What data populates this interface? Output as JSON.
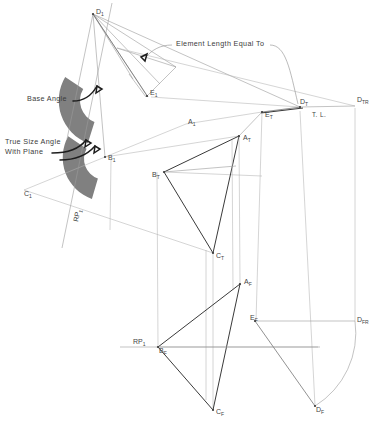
{
  "drawing": {
    "title": "Descriptive Geometry Multiview Construction",
    "width": 390,
    "height": 432,
    "background": "#ffffff",
    "colors": {
      "paper": "#ffffff",
      "thin_line": "#9a9a9a",
      "light_line": "#b2b2b2",
      "heavy_line": "#3a3a3a",
      "medium_line": "#6d6d6d",
      "leader": "#8d8d8d",
      "arrow": "#1d1d1d",
      "wedge_fill": "#808080",
      "text": "#444444"
    }
  },
  "annotations": [
    {
      "name": "element-length-note",
      "text": "Element Length Equal To",
      "x": 176,
      "y": 46,
      "anchor": "start"
    },
    {
      "name": "base-angle-note",
      "text": "Base Angle",
      "x": 27,
      "y": 101,
      "anchor": "start"
    },
    {
      "name": "true-size-angle-note-line1",
      "text": "True Size Angle",
      "x": 5,
      "y": 144,
      "anchor": "start"
    },
    {
      "name": "true-size-angle-note-line2",
      "text": "With Plane",
      "x": 5,
      "y": 154,
      "anchor": "start"
    },
    {
      "name": "true-length-note",
      "text": "T. L.",
      "x": 312,
      "y": 117,
      "anchor": "start"
    }
  ],
  "points": [
    {
      "name": "point-D1",
      "base": "D",
      "sub": "1",
      "x": 93,
      "y": 14,
      "lx": 96,
      "ly": 14,
      "marker": true
    },
    {
      "name": "point-E1",
      "base": "E",
      "sub": "1",
      "x": 147,
      "y": 96,
      "lx": 150,
      "ly": 95,
      "marker": true
    },
    {
      "name": "point-A1",
      "base": "A",
      "sub": "1",
      "x": 186,
      "y": 124,
      "lx": 188,
      "ly": 124,
      "marker": false
    },
    {
      "name": "point-B1",
      "base": "B",
      "sub": "1",
      "x": 105,
      "y": 157,
      "lx": 108,
      "ly": 160,
      "marker": true
    },
    {
      "name": "point-C1",
      "base": "C",
      "sub": "1",
      "x": 24,
      "y": 190,
      "lx": 24,
      "ly": 196,
      "marker": false
    },
    {
      "name": "point-AT",
      "base": "A",
      "sub": "T",
      "x": 239,
      "y": 136,
      "lx": 243,
      "ly": 140,
      "marker": true
    },
    {
      "name": "point-BT",
      "base": "B",
      "sub": "T",
      "x": 164,
      "y": 172,
      "lx": 152,
      "ly": 177,
      "marker": true
    },
    {
      "name": "point-CT",
      "base": "C",
      "sub": "T",
      "x": 213,
      "y": 253,
      "lx": 216,
      "ly": 258,
      "marker": true
    },
    {
      "name": "point-ET",
      "base": "E",
      "sub": "T",
      "x": 262,
      "y": 112,
      "lx": 265,
      "ly": 117,
      "marker": true
    },
    {
      "name": "point-DT",
      "base": "D",
      "sub": "T",
      "x": 300,
      "y": 107,
      "lx": 300,
      "ly": 104,
      "marker": true
    },
    {
      "name": "point-DTR",
      "base": "D",
      "sub": "TR",
      "x": 355,
      "y": 106,
      "lx": 357,
      "ly": 102,
      "marker": false
    },
    {
      "name": "point-AF",
      "base": "A",
      "sub": "F",
      "x": 240,
      "y": 284,
      "lx": 244,
      "ly": 284,
      "marker": true
    },
    {
      "name": "point-BF",
      "base": "B",
      "sub": "F",
      "x": 158,
      "y": 347,
      "lx": 159,
      "ly": 353,
      "marker": true
    },
    {
      "name": "point-CF",
      "base": "C",
      "sub": "F",
      "x": 213,
      "y": 410,
      "lx": 216,
      "ly": 414,
      "marker": true
    },
    {
      "name": "point-EF",
      "base": "E",
      "sub": "F",
      "x": 255,
      "y": 321,
      "lx": 250,
      "ly": 320,
      "marker": true
    },
    {
      "name": "point-DF",
      "base": "D",
      "sub": "F",
      "x": 315,
      "y": 406,
      "lx": 316,
      "ly": 412,
      "marker": true
    },
    {
      "name": "point-DFR",
      "base": "D",
      "sub": "FR",
      "x": 355,
      "y": 321,
      "lx": 357,
      "ly": 322,
      "marker": false
    }
  ],
  "reference_planes": [
    {
      "name": "reference-plane-aux",
      "base": "RP",
      "sub": "1",
      "lx": 78,
      "ly": 222,
      "rotated": true
    },
    {
      "name": "reference-plane-front",
      "base": "RP",
      "sub": "1",
      "lx": 133,
      "ly": 344,
      "rotated": false
    }
  ],
  "views": {
    "auxiliary": {
      "label": "Auxiliary / True Size View"
    },
    "top": {
      "label": "Top View"
    },
    "front": {
      "label": "Front View"
    }
  },
  "wedges": [
    {
      "name": "base-angle-wedge",
      "cx": 105,
      "cy": 100,
      "r_outer": 46,
      "r_inner": 22,
      "a_start": 150,
      "a_end": 248,
      "fill": "#808080"
    },
    {
      "name": "true-size-angle-wedge",
      "cx": 107,
      "cy": 157,
      "r_outer": 44,
      "r_inner": 20,
      "a_start": 152,
      "a_end": 250,
      "fill": "#808080"
    }
  ]
}
